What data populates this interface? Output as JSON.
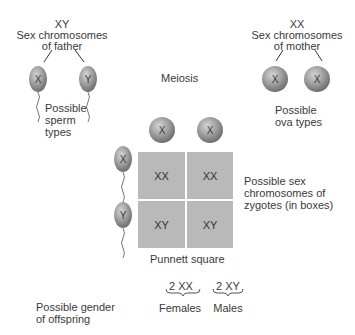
{
  "father": {
    "genotype": "XY",
    "label_line1": "Sex chromosomes",
    "label_line2": "of father",
    "sperm": [
      "X",
      "Y"
    ],
    "sperm_label": [
      "Possible",
      "sperm",
      "types"
    ]
  },
  "mother": {
    "genotype": "XX",
    "label_line1": "Sex chromosomes",
    "label_line2": "of mother",
    "ova": [
      "X",
      "X"
    ],
    "ova_label": [
      "Possible",
      "ova types"
    ]
  },
  "meiosis_label": "Meiosis",
  "punnett": {
    "col_headers": [
      "X",
      "X"
    ],
    "row_headers": [
      "X",
      "Y"
    ],
    "cells": [
      [
        "XX",
        "XX"
      ],
      [
        "XY",
        "XY"
      ]
    ],
    "caption": "Punnett square",
    "side_label": [
      "Possible sex",
      "chromosomes of",
      "zygotes (in boxes)"
    ]
  },
  "offspring": {
    "label": [
      "Possible gender",
      "of offspring"
    ],
    "groups": [
      {
        "count": "2 XX",
        "gender": "Females"
      },
      {
        "count": "2 XY",
        "gender": "Males"
      }
    ]
  },
  "colors": {
    "cell": "#b9b9b9",
    "cell_gap": "#e6e6e6",
    "gamete": "#8f8f8f",
    "text": "#3a3a3a"
  }
}
